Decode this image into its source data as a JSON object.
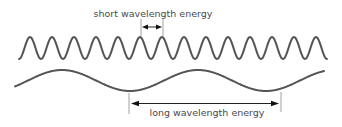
{
  "diagram": {
    "short_wave": {
      "label": "short wavelength energy",
      "period_px": 22,
      "peak_count": 14,
      "color": "#555555"
    },
    "long_wave": {
      "label": "long wavelength energy",
      "period_px": 136,
      "color": "#555555"
    }
  }
}
